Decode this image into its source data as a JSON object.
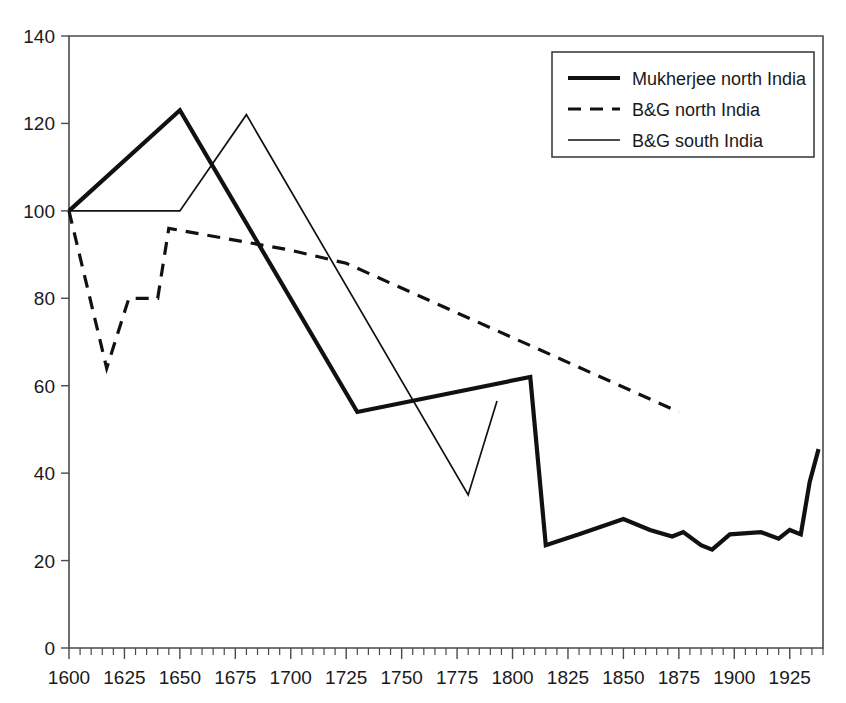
{
  "chart_data": {
    "type": "line",
    "title": "",
    "subtitle": "",
    "xlabel": "",
    "ylabel": "",
    "xlim": [
      1600,
      1940
    ],
    "ylim": [
      0,
      140
    ],
    "grid": false,
    "legend_position": "top-right",
    "x_ticks": [
      1600,
      1625,
      1650,
      1675,
      1700,
      1725,
      1750,
      1775,
      1800,
      1825,
      1850,
      1875,
      1900,
      1925
    ],
    "x_tick_labels": [
      "1600",
      "1625",
      "1650",
      "1675",
      "1700",
      "1725",
      "1750",
      "1775",
      "1800",
      "1825",
      "1850",
      "1875",
      "1900",
      "1925"
    ],
    "x_minor_step": 5,
    "y_ticks": [
      0,
      20,
      40,
      60,
      80,
      100,
      120,
      140
    ],
    "y_tick_labels": [
      "0",
      "20",
      "40",
      "60",
      "80",
      "100",
      "120",
      "140"
    ],
    "series": [
      {
        "name": "Mukherjee north India",
        "style": "thick-solid",
        "color": "#111111",
        "points": [
          [
            1600,
            100
          ],
          [
            1650,
            123
          ],
          [
            1730,
            54
          ],
          [
            1808,
            62
          ],
          [
            1815,
            23.5
          ],
          [
            1830,
            26
          ],
          [
            1850,
            29.5
          ],
          [
            1862,
            27
          ],
          [
            1872,
            25.5
          ],
          [
            1877,
            26.5
          ],
          [
            1885,
            23.5
          ],
          [
            1890,
            22.5
          ],
          [
            1898,
            26
          ],
          [
            1912,
            26.5
          ],
          [
            1920,
            25
          ],
          [
            1925,
            27
          ],
          [
            1930,
            26
          ],
          [
            1934,
            38
          ],
          [
            1938,
            45.5
          ]
        ]
      },
      {
        "name": "B&G north India",
        "style": "dashed",
        "color": "#111111",
        "points": [
          [
            1600,
            100
          ],
          [
            1617,
            64
          ],
          [
            1627,
            80
          ],
          [
            1640,
            80
          ],
          [
            1645,
            96
          ],
          [
            1700,
            91
          ],
          [
            1725,
            88
          ],
          [
            1875,
            54
          ]
        ]
      },
      {
        "name": "B&G south India",
        "style": "thin-solid",
        "color": "#111111",
        "points": [
          [
            1600,
            100
          ],
          [
            1650,
            100
          ],
          [
            1680,
            122
          ],
          [
            1780,
            35
          ],
          [
            1793,
            56.5
          ]
        ]
      }
    ]
  },
  "legend": {
    "entries": [
      {
        "label": "Mukherjee north India",
        "style": "thick-solid"
      },
      {
        "label": "B&G north India",
        "style": "dashed"
      },
      {
        "label": "B&G south India",
        "style": "thin-solid"
      }
    ]
  }
}
